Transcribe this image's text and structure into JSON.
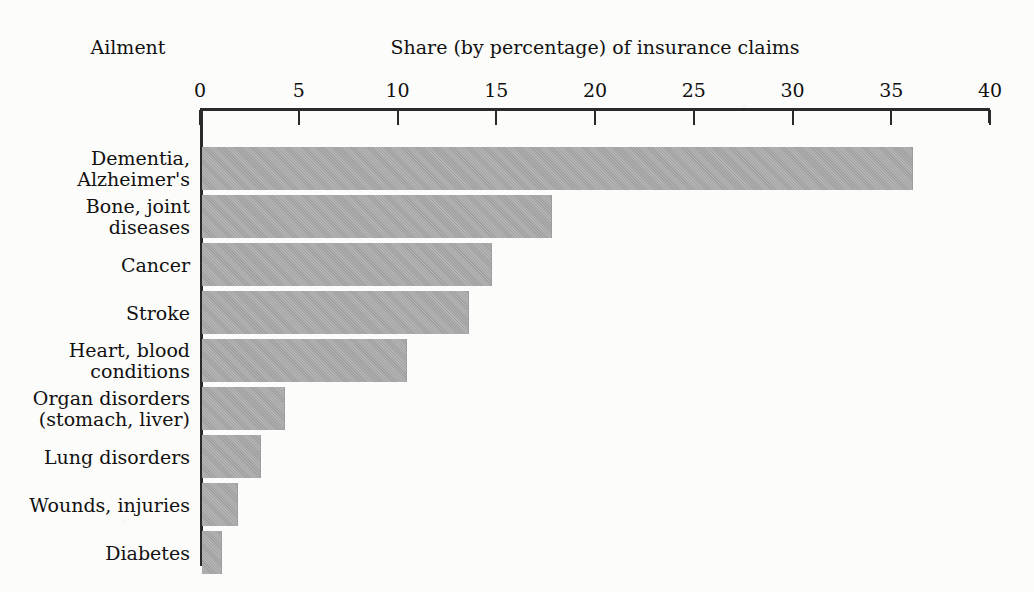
{
  "headers": {
    "category_axis_header": "Ailment",
    "title": "Share (by percentage) of insurance claims"
  },
  "chart_data": {
    "type": "bar",
    "orientation": "horizontal",
    "title": "Share (by percentage) of insurance claims",
    "xlabel": "Share (by percentage) of insurance claims",
    "ylabel": "Ailment",
    "xlim": [
      0,
      40
    ],
    "xticks": [
      0,
      5,
      10,
      15,
      20,
      25,
      30,
      35,
      40
    ],
    "xtick_labels": [
      "0",
      "5",
      "10",
      "15",
      "20",
      "25",
      "30",
      "35",
      "40"
    ],
    "grid": false,
    "legend": null,
    "bar_color": "#a9a9a9",
    "axis_color": "#2a2a2a",
    "categories": [
      "Dementia,\nAlzheimer's",
      "Bone, joint\ndiseases",
      "Cancer",
      "Stroke",
      "Heart, blood\nconditions",
      "Organ disorders\n(stomach, liver)",
      "Lung disorders",
      "Wounds, injuries",
      "Diabetes"
    ],
    "values": [
      36.0,
      17.7,
      14.7,
      13.5,
      10.4,
      4.2,
      3.0,
      1.8,
      1.0
    ]
  }
}
